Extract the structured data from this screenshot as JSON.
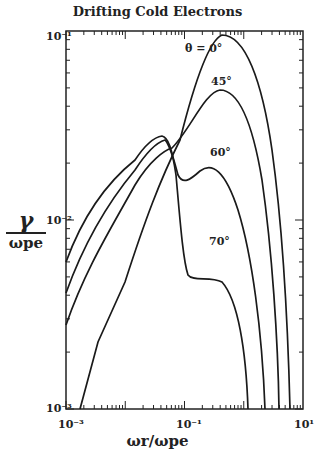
{
  "chart_data": {
    "type": "line",
    "title": "Drifting Cold Electrons",
    "xlabel": "ω_r / ω_pe",
    "ylabel": "γ / ω_pe",
    "xscale": "log",
    "yscale": "log",
    "xlim": [
      0.001,
      10
    ],
    "ylim": [
      0.001,
      0.1
    ],
    "x_tick_labels": [
      "10^-3",
      "10^-1",
      "10^1"
    ],
    "y_tick_labels": [
      "10^-3",
      "10^-2",
      "10^-1"
    ],
    "grid": false,
    "legend": "none (curves labeled inline)",
    "series": [
      {
        "name": "θ = 0°",
        "label": "θ = 0°",
        "x": [
          0.0013,
          0.004,
          0.01,
          0.03,
          0.06,
          0.1,
          0.2,
          0.3,
          0.5,
          1.0,
          2.0,
          4.0,
          6.0
        ],
        "y": [
          0.001,
          0.0022,
          0.0045,
          0.011,
          0.02,
          0.033,
          0.07,
          0.09,
          0.097,
          0.08,
          0.04,
          0.008,
          0.001
        ]
      },
      {
        "name": "45°",
        "label": "45°",
        "x": [
          0.001,
          0.003,
          0.01,
          0.03,
          0.05,
          0.07,
          0.1,
          0.2,
          0.35,
          0.6,
          1.0,
          2.0,
          3.5
        ],
        "y": [
          0.0029,
          0.006,
          0.012,
          0.022,
          0.026,
          0.029,
          0.032,
          0.042,
          0.046,
          0.042,
          0.028,
          0.008,
          0.001
        ]
      },
      {
        "name": "60°",
        "label": "60°",
        "x": [
          0.001,
          0.003,
          0.01,
          0.03,
          0.05,
          0.065,
          0.08,
          0.1,
          0.14,
          0.2,
          0.35,
          0.7,
          1.2,
          2.0
        ],
        "y": [
          0.0043,
          0.009,
          0.016,
          0.026,
          0.031,
          0.032,
          0.028,
          0.02,
          0.018,
          0.0195,
          0.02,
          0.012,
          0.005,
          0.001
        ]
      },
      {
        "name": "70°",
        "label": "70°",
        "x": [
          0.001,
          0.003,
          0.01,
          0.03,
          0.05,
          0.065,
          0.08,
          0.1,
          0.14,
          0.2,
          0.3,
          0.5,
          0.8,
          1.1
        ],
        "y": [
          0.006,
          0.012,
          0.02,
          0.03,
          0.033,
          0.033,
          0.03,
          0.022,
          0.008,
          0.0066,
          0.0066,
          0.005,
          0.002,
          0.001
        ]
      }
    ]
  },
  "labels": {
    "title": "Drifting Cold Electrons",
    "ylabel_num": "γ",
    "ylabel_den": "ωpe",
    "xlabel": "ωr/ωpe",
    "x_ticks": [
      "10⁻³",
      "10⁻¹",
      "10¹"
    ],
    "y_ticks": [
      "10⁻¹",
      "10⁻²",
      "10⁻³"
    ],
    "ann_0": "θ = 0°",
    "ann_45": "45°",
    "ann_60": "60°",
    "ann_70": "70°"
  }
}
